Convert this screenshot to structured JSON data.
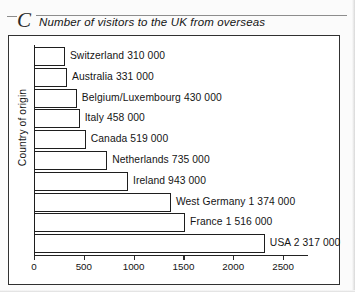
{
  "section_letter": "C",
  "chart_data": {
    "type": "bar",
    "orientation": "horizontal",
    "title": "Number of visitors to the UK from overseas",
    "xlabel": "Number of visitors (thousands)",
    "ylabel": "Country of origin",
    "xlim": [
      0,
      2750
    ],
    "xticks": [
      "0",
      "500",
      "1000",
      "1500",
      "2000",
      "2500"
    ],
    "xtick_values": [
      0,
      500,
      1000,
      1500,
      2000,
      2500
    ],
    "grid": false,
    "legend": null,
    "categories": [
      "Switzerland",
      "Australia",
      "Belgium/Luxembourg",
      "Italy",
      "Canada",
      "Netherlands",
      "Ireland",
      "West Germany",
      "France",
      "USA"
    ],
    "values": [
      310,
      331,
      430,
      458,
      519,
      735,
      943,
      1374,
      1516,
      2317
    ],
    "bars": [
      {
        "category": "Switzerland",
        "value": 310,
        "label": "Switzerland  310 000"
      },
      {
        "category": "Australia",
        "value": 331,
        "label": "Australia 331 000"
      },
      {
        "category": "Belgium/Luxembourg",
        "value": 430,
        "label": "Belgium/Luxembourg 430 000"
      },
      {
        "category": "Italy",
        "value": 458,
        "label": "Italy  458 000"
      },
      {
        "category": "Canada",
        "value": 519,
        "label": "Canada  519 000"
      },
      {
        "category": "Netherlands",
        "value": 735,
        "label": "Netherlands  735 000"
      },
      {
        "category": "Ireland",
        "value": 943,
        "label": "Ireland  943 000"
      },
      {
        "category": "West Germany",
        "value": 1374,
        "label": "West Germany  1 374 000"
      },
      {
        "category": "France",
        "value": 1516,
        "label": "France 1 516 000"
      },
      {
        "category": "USA",
        "value": 2317,
        "label": "USA  2 317 000"
      }
    ],
    "colors": {
      "bar_fill": "#ffffff",
      "bar_stroke": "#1e1e1e",
      "axis": "#222222",
      "text": "#141414",
      "background": "#ffffff"
    }
  }
}
